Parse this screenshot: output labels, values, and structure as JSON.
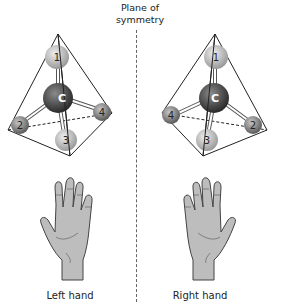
{
  "title": {
    "line1": "Plane of",
    "line2": "symmetry"
  },
  "left_molecule": {
    "center_atom": "C",
    "atoms": [
      "1",
      "2",
      "3",
      "4"
    ]
  },
  "right_molecule": {
    "center_atom": "C",
    "atoms": [
      "1",
      "4",
      "3",
      "2"
    ]
  },
  "labels": {
    "left_hand": "Left hand",
    "right_hand": "Right hand"
  },
  "colors": {
    "carbon": "#3a3a3a",
    "substituent": "#9a9a9a",
    "hand_fill": "#bdbdbd",
    "outline": "#222222"
  }
}
